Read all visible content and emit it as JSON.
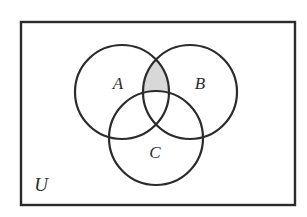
{
  "figure": {
    "type": "venn-diagram-3-set",
    "background_color": "#ffffff",
    "stroke_color": "#2b2b2b",
    "shade_color": "#d8d8d8",
    "stroke_width": 2.2,
    "rect_stroke_width": 2.4
  },
  "universe": {
    "label": "U",
    "label_x": 41,
    "label_y": 191,
    "label_size": 19,
    "rect": {
      "x": 21,
      "y": 22,
      "width": 274,
      "height": 183
    }
  },
  "sets": [
    {
      "id": "A",
      "label": "A",
      "cx": 122,
      "cy": 92,
      "r": 47,
      "label_x": 118,
      "label_y": 89,
      "label_size": 17
    },
    {
      "id": "B",
      "label": "B",
      "cx": 190,
      "cy": 92,
      "r": 47,
      "label_x": 200,
      "label_y": 89,
      "label_size": 17
    },
    {
      "id": "C",
      "label": "C",
      "cx": 156,
      "cy": 138,
      "r": 47,
      "label_x": 155,
      "label_y": 158,
      "label_size": 17
    }
  ],
  "shaded_regions": [
    {
      "name": "A-intersect-B-minus-C",
      "expression": "(A ∩ B) − C",
      "color": "#d8d8d8"
    }
  ]
}
